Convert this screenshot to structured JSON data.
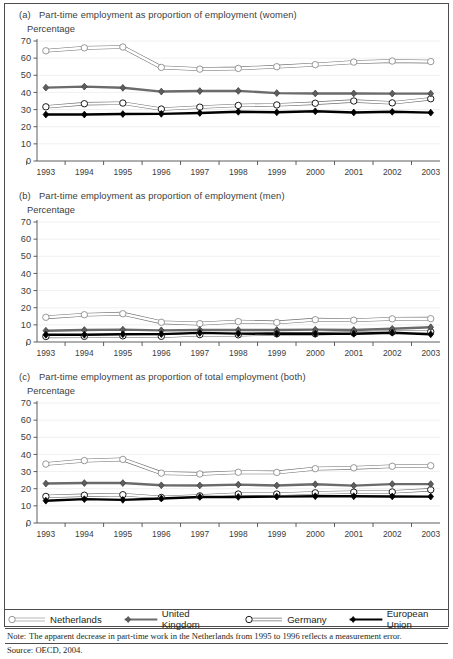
{
  "figure": {
    "note_label": "Note:",
    "note_text": "The apparent decrease in part-time work in the Netherlands from 1995 to 1996 reflects a measurement error.",
    "source": "Source: OECD, 2004."
  },
  "legend": {
    "items": [
      {
        "label": "Netherlands",
        "marker": "open-circle",
        "color": "#d9d9d9",
        "stroke": "#9a9a9a"
      },
      {
        "label": "United Kingdom",
        "marker": "filled-diamond",
        "color": "#595959",
        "stroke": "#3b3b3b"
      },
      {
        "label": "Germany",
        "marker": "open-circle",
        "color": "#ffffff",
        "stroke": "#1a1a1a"
      },
      {
        "label": "European Union",
        "marker": "filled-diamond",
        "color": "#000000",
        "stroke": "#000000"
      }
    ]
  },
  "panels": [
    {
      "tag": "(a)",
      "title": "Part-time employment as proportion of employment (women)",
      "axis_label": "Percentage"
    },
    {
      "tag": "(b)",
      "title": "Part-time employment as proportion of employment (men)",
      "axis_label": "Percentage"
    },
    {
      "tag": "(c)",
      "title": "Part-time employment as proportion of total employment (both)",
      "axis_label": "Percentage"
    }
  ],
  "chart_data": [
    {
      "type": "line",
      "panel": "(a)",
      "title": "Part-time employment as proportion of employment (women)",
      "xlabel": "",
      "ylabel": "Percentage",
      "ylim": [
        0,
        70
      ],
      "yticks": [
        0,
        10,
        20,
        30,
        40,
        50,
        60,
        70
      ],
      "grid": true,
      "legend_position": "bottom-shared",
      "categories": [
        "1993",
        "1994",
        "1995",
        "1996",
        "1997",
        "1998",
        "1999",
        "2000",
        "2001",
        "2002",
        "2003"
      ],
      "series": [
        {
          "name": "Netherlands",
          "values": [
            64.3,
            66.0,
            66.5,
            54.6,
            53.6,
            54.0,
            55.0,
            56.2,
            57.7,
            58.3,
            58.0
          ]
        },
        {
          "name": "United Kingdom",
          "values": [
            42.8,
            43.4,
            42.7,
            40.5,
            40.8,
            40.9,
            39.6,
            39.4,
            39.4,
            39.3,
            39.3
          ]
        },
        {
          "name": "Germany",
          "values": [
            31.6,
            33.4,
            33.8,
            30.3,
            31.4,
            32.4,
            32.7,
            33.7,
            35.0,
            33.9,
            36.3
          ]
        },
        {
          "name": "European Union",
          "values": [
            27.1,
            27.1,
            27.4,
            27.5,
            28.0,
            28.7,
            28.4,
            29.0,
            28.3,
            28.7,
            28.2
          ]
        }
      ]
    },
    {
      "type": "line",
      "panel": "(b)",
      "title": "Part-time employment as proportion of employment (men)",
      "xlabel": "",
      "ylabel": "Percentage",
      "ylim": [
        0,
        70
      ],
      "yticks": [
        0,
        10,
        20,
        30,
        40,
        50,
        60,
        70
      ],
      "grid": true,
      "legend_position": "bottom-shared",
      "categories": [
        "1993",
        "1994",
        "1995",
        "1996",
        "1997",
        "1998",
        "1999",
        "2000",
        "2001",
        "2002",
        "2003"
      ],
      "series": [
        {
          "name": "Netherlands",
          "values": [
            14.4,
            15.9,
            16.5,
            11.5,
            10.7,
            11.9,
            11.4,
            13.0,
            12.7,
            13.5,
            13.6
          ]
        },
        {
          "name": "United Kingdom",
          "values": [
            6.6,
            7.0,
            7.2,
            6.8,
            7.0,
            7.0,
            7.0,
            7.2,
            7.0,
            7.7,
            8.6
          ]
        },
        {
          "name": "Germany",
          "values": [
            3.2,
            3.3,
            3.6,
            3.3,
            4.3,
            4.2,
            4.8,
            4.8,
            5.3,
            5.8,
            6.0
          ]
        },
        {
          "name": "European Union",
          "values": [
            4.2,
            4.2,
            4.5,
            4.6,
            5.3,
            4.9,
            4.8,
            4.8,
            4.8,
            5.4,
            4.5
          ]
        }
      ]
    },
    {
      "type": "line",
      "panel": "(c)",
      "title": "Part-time employment as proportion of total employment (both)",
      "xlabel": "",
      "ylabel": "Percentage",
      "ylim": [
        0,
        70
      ],
      "yticks": [
        0,
        10,
        20,
        30,
        40,
        50,
        60,
        70
      ],
      "grid": true,
      "legend_position": "bottom-shared",
      "categories": [
        "1993",
        "1994",
        "1995",
        "1996",
        "1997",
        "1998",
        "1999",
        "2000",
        "2001",
        "2002",
        "2003"
      ],
      "series": [
        {
          "name": "Netherlands",
          "values": [
            34.4,
            36.4,
            37.1,
            29.1,
            28.6,
            29.6,
            29.5,
            31.7,
            32.2,
            33.1,
            33.4
          ]
        },
        {
          "name": "United Kingdom",
          "values": [
            23.0,
            23.3,
            23.3,
            22.0,
            21.9,
            22.4,
            21.9,
            22.6,
            21.8,
            22.7,
            22.7
          ]
        },
        {
          "name": "Germany",
          "values": [
            15.5,
            16.2,
            16.5,
            14.9,
            15.8,
            16.9,
            16.9,
            17.6,
            18.0,
            18.1,
            19.4
          ]
        },
        {
          "name": "European Union",
          "values": [
            13.0,
            13.9,
            13.5,
            14.3,
            15.2,
            15.2,
            15.4,
            15.6,
            15.6,
            15.5,
            15.4
          ]
        }
      ]
    }
  ]
}
